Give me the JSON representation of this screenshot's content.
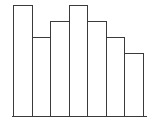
{
  "chart_data": {
    "type": "bar",
    "title": "",
    "xlabel": "",
    "ylabel": "",
    "categories": [
      "1",
      "2",
      "3",
      "4",
      "5",
      "6",
      "7"
    ],
    "values": [
      7,
      5,
      6,
      7,
      6,
      5,
      4
    ],
    "ylim": [
      0,
      7
    ],
    "grid": false,
    "legend": null,
    "colors": {
      "bar_fill": "#ffffff",
      "bar_stroke": "#3a3a3a"
    }
  },
  "layout": {
    "bar_left": 13,
    "bar_width": 18.5,
    "baseline_y": 117,
    "unit_px": 16
  }
}
